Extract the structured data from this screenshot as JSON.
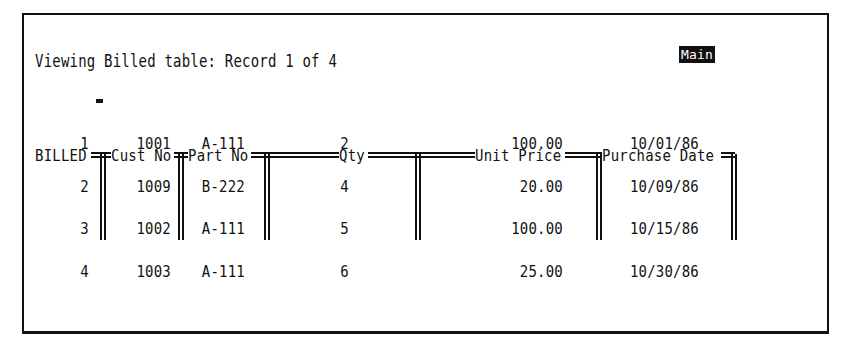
{
  "status": {
    "text": "Viewing Billed table: Record 1 of 4",
    "mode": "Main"
  },
  "table": {
    "name": "BILLED",
    "columns": [
      {
        "key": "record",
        "label": "BILLED"
      },
      {
        "key": "cust_no",
        "label": "Cust No"
      },
      {
        "key": "part_no",
        "label": "Part No"
      },
      {
        "key": "qty",
        "label": "Qty"
      },
      {
        "key": "unit_price",
        "label": "Unit Price"
      },
      {
        "key": "purchase_date",
        "label": "Purchase Date"
      }
    ],
    "rows": [
      {
        "record": "1",
        "cust_no": "1001",
        "part_no": "A-111",
        "qty": "2",
        "unit_price": "100.00",
        "purchase_date": "10/01/86"
      },
      {
        "record": "2",
        "cust_no": "1009",
        "part_no": "B-222",
        "qty": "4",
        "unit_price": "20.00",
        "purchase_date": "10/09/86"
      },
      {
        "record": "3",
        "cust_no": "1002",
        "part_no": "A-111",
        "qty": "5",
        "unit_price": "100.00",
        "purchase_date": "10/15/86"
      },
      {
        "record": "4",
        "cust_no": "1003",
        "part_no": "A-111",
        "qty": "6",
        "unit_price": "25.00",
        "purchase_date": "10/30/86"
      }
    ],
    "current_record": 1
  }
}
